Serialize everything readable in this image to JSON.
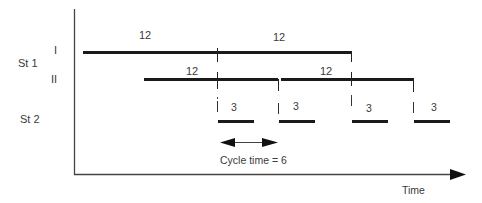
{
  "diagram": {
    "type": "gantt-timeline",
    "axis": {
      "x_label": "Time"
    },
    "rows": [
      {
        "station": "St 1",
        "sub_rows": [
          {
            "label": "I",
            "segments": [
              {
                "duration": 12,
                "label": "12"
              },
              {
                "duration": 12,
                "label": "12"
              }
            ]
          },
          {
            "label": "II",
            "segments": [
              {
                "duration": 12,
                "label": "12"
              },
              {
                "duration": 12,
                "label": "12"
              }
            ]
          }
        ]
      },
      {
        "station": "St 2",
        "segments": [
          {
            "duration": 3,
            "label": "3"
          },
          {
            "duration": 3,
            "label": "3"
          },
          {
            "duration": 3,
            "label": "3"
          },
          {
            "duration": 3,
            "label": "3"
          }
        ]
      }
    ],
    "annotation": {
      "text": "Cycle time = 6"
    }
  },
  "labels": {
    "st1": "St 1",
    "st2": "St 2",
    "row_i": "I",
    "row_ii": "II",
    "i_seg1": "12",
    "i_seg2": "12",
    "ii_seg1": "12",
    "ii_seg2": "12",
    "st2_seg1": "3",
    "st2_seg2": "3",
    "st2_seg3": "3",
    "st2_seg4": "3",
    "cycle_time": "Cycle time = 6",
    "time": "Time"
  },
  "colors": {
    "bar": "#1a1a1a",
    "axis": "#333333",
    "text": "#3a3a3a"
  }
}
